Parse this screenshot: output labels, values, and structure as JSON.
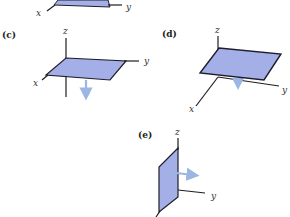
{
  "figure": {
    "colors": {
      "plane_fill": "#a3afe6",
      "plane_edge": "#1e1e2a",
      "axis": "#1e1e1e",
      "arrow": "#9bb6e2"
    },
    "panels": [
      {
        "id": "b",
        "label": "",
        "axes": {
          "x": "x",
          "y": "y"
        },
        "partial": true
      },
      {
        "id": "c",
        "label": "(c)",
        "axes": {
          "z": "z",
          "y": "y",
          "x": "x"
        },
        "orientation": "horizontal plane",
        "normal": "down"
      },
      {
        "id": "d",
        "label": "(d)",
        "axes": {
          "z": "z",
          "y": "y",
          "x": "x"
        },
        "orientation": "horizontal plane",
        "normal": "down"
      },
      {
        "id": "e",
        "label": "(e)",
        "axes": {
          "z": "z",
          "y": "y"
        },
        "orientation": "vertical plane",
        "normal": "+y"
      }
    ]
  }
}
